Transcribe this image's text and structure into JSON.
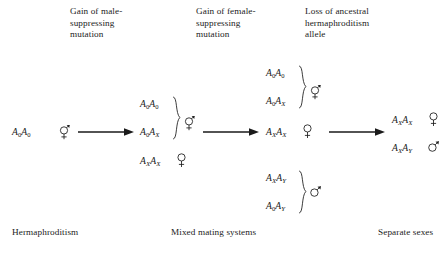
{
  "diagram": {
    "title_headers": [
      {
        "id": "header-male-suppressing",
        "text": "Gain of male-\nsuppressing\nmutation"
      },
      {
        "id": "header-female-suppressing",
        "text": "Gain of female-\nsuppressing\nmutation"
      },
      {
        "id": "header-loss-ancestral",
        "text": "Loss of ancestral\nhermaphroditism\nallele"
      }
    ],
    "stage_labels": [
      {
        "id": "stage-hermaphroditism",
        "text": "Hermaphroditism"
      },
      {
        "id": "stage-mixed-mating",
        "text": "Mixed mating systems"
      },
      {
        "id": "stage-separate-sexes",
        "text": "Separate sexes"
      }
    ],
    "genotypes": {
      "stage1": [
        {
          "allele1": "A",
          "sub1": "0",
          "allele2": "A",
          "sub2": "0",
          "sex": "hermaphrodite"
        }
      ],
      "stage2": [
        {
          "allele1": "A",
          "sub1": "0",
          "allele2": "A",
          "sub2": "0",
          "sex": "hermaphrodite",
          "grouped": "true"
        },
        {
          "allele1": "A",
          "sub1": "0",
          "allele2": "A",
          "sub2": "X",
          "sex": "hermaphrodite",
          "grouped": "true"
        },
        {
          "allele1": "A",
          "sub1": "X",
          "allele2": "A",
          "sub2": "X",
          "sex": "female",
          "grouped": "false"
        }
      ],
      "stage3": [
        {
          "allele1": "A",
          "sub1": "0",
          "allele2": "A",
          "sub2": "0",
          "sex": "hermaphrodite",
          "grouped": "true"
        },
        {
          "allele1": "A",
          "sub1": "0",
          "allele2": "A",
          "sub2": "X",
          "sex": "hermaphrodite",
          "grouped": "true"
        },
        {
          "allele1": "A",
          "sub1": "X",
          "allele2": "A",
          "sub2": "X",
          "sex": "female",
          "grouped": "false"
        },
        {
          "allele1": "A",
          "sub1": "X",
          "allele2": "A",
          "sub2": "Y",
          "sex": "male",
          "grouped": "true"
        },
        {
          "allele1": "A",
          "sub1": "0",
          "allele2": "A",
          "sub2": "Y",
          "sex": "male",
          "grouped": "true"
        }
      ],
      "stage4": [
        {
          "allele1": "A",
          "sub1": "X",
          "allele2": "A",
          "sub2": "X",
          "sex": "female"
        },
        {
          "allele1": "A",
          "sub1": "X",
          "allele2": "A",
          "sub2": "Y",
          "sex": "male"
        }
      ]
    },
    "sex_symbols": {
      "male": "♂",
      "female": "♀",
      "hermaphrodite": "⚥"
    },
    "arrow_count": 3,
    "colors": {
      "background": "#ffffff",
      "text": "#222222",
      "ink": "#1a1a1a"
    }
  }
}
